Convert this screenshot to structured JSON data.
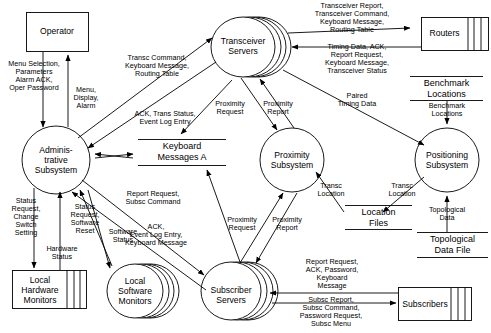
{
  "diagram": {
    "nodes": {
      "operator": {
        "label": "Operator",
        "type": "external-entity"
      },
      "transceiver_servers": {
        "label": "Transceiver\nServers",
        "type": "process-multi"
      },
      "routers": {
        "label": "Routers",
        "type": "external-entity-multi"
      },
      "benchmark_locations_store": {
        "label": "Benchmark\nLocations",
        "type": "data-store"
      },
      "administrative_subsystem": {
        "label": "Adminis-\ntrative\nSubsystem",
        "type": "process"
      },
      "keyboard_messages_a": {
        "label": "Keyboard\nMessages A",
        "type": "data-store"
      },
      "proximity_subsystem": {
        "label": "Proximity\nSubsystem",
        "type": "process"
      },
      "positioning_subsystem": {
        "label": "Positioning\nSubsystem",
        "type": "process"
      },
      "location_files": {
        "label": "Location\nFiles",
        "type": "data-store"
      },
      "topological_data_file": {
        "label": "Topological\nData File",
        "type": "data-store"
      },
      "local_hardware_monitors": {
        "label": "Local\nHardware\nMonitors",
        "type": "external-entity-multi"
      },
      "local_software_monitors": {
        "label": "Local\nSoftware\nMonitors",
        "type": "process-multi"
      },
      "subscriber_servers": {
        "label": "Subscriber\nServers",
        "type": "process-multi"
      },
      "subscribers": {
        "label": "Subscribers",
        "type": "external-entity-multi"
      }
    },
    "flows": [
      {
        "id": "f1",
        "label": "Menu Selection,\nParameters\nAlarm ACK,\nOper Password",
        "from": "operator",
        "to": "administrative_subsystem"
      },
      {
        "id": "f2",
        "label": "Menu,\nDisplay,\nAlarm",
        "from": "administrative_subsystem",
        "to": "operator"
      },
      {
        "id": "f3",
        "label": "Transc Command,\nKeyboard Message,\nRouting Table",
        "from": "administrative_subsystem",
        "to": "transceiver_servers"
      },
      {
        "id": "f4",
        "label": "ACK, Trans Status,\nEvent Log Entry",
        "from": "transceiver_servers",
        "to": "administrative_subsystem"
      },
      {
        "id": "f5",
        "label": "Transceiver Report,\nTransceiver Command,\nKeyboard Message,\nRouting Table",
        "from": "transceiver_servers",
        "to": "routers"
      },
      {
        "id": "f6",
        "label": "Timing Data, ACK,\nReport Request,\nKeyboard Message,\nTransceiver Status",
        "from": "routers",
        "to": "transceiver_servers"
      },
      {
        "id": "f7",
        "label": "Paired\nTiming Data",
        "from": "transceiver_servers",
        "to": "positioning_subsystem"
      },
      {
        "id": "f8",
        "label": "Benchmark\nLocations",
        "from": "benchmark_locations_store",
        "to": "positioning_subsystem"
      },
      {
        "id": "f9",
        "label": "Topological\nData",
        "from": "topological_data_file",
        "to": "positioning_subsystem"
      },
      {
        "id": "f10",
        "label": "Transc\nLocation",
        "from": "positioning_subsystem",
        "to": "location_files"
      },
      {
        "id": "f11",
        "label": "Transc\nLocation",
        "from": "location_files",
        "to": "proximity_subsystem"
      },
      {
        "id": "f12",
        "label": "Proximity\nRequest",
        "from": "transceiver_servers",
        "to": "proximity_subsystem"
      },
      {
        "id": "f13",
        "label": "Proximity\nReport",
        "from": "proximity_subsystem",
        "to": "transceiver_servers"
      },
      {
        "id": "f14",
        "label": "Proximity\nRequest",
        "from": "subscriber_servers",
        "to": "proximity_subsystem"
      },
      {
        "id": "f15",
        "label": "Proximity\nReport",
        "from": "proximity_subsystem",
        "to": "subscriber_servers"
      },
      {
        "id": "f16",
        "label": "Report Request,\nSubsc Command",
        "from": "administrative_subsystem",
        "to": "subscriber_servers"
      },
      {
        "id": "f17",
        "label": "ACK,\nEvent Log Entry,\nKeyboard Message",
        "from": "subscriber_servers",
        "to": "administrative_subsystem"
      },
      {
        "id": "f18",
        "label": "Status\nRequest,\nChange\nSwitch\nSetting",
        "from": "administrative_subsystem",
        "to": "local_hardware_monitors"
      },
      {
        "id": "f19",
        "label": "Hardware\nStatus",
        "from": "local_hardware_monitors",
        "to": "administrative_subsystem"
      },
      {
        "id": "f20",
        "label": "Status\nRequest,\nSoftware\nReset",
        "from": "administrative_subsystem",
        "to": "local_software_monitors"
      },
      {
        "id": "f21",
        "label": "Software\nStatus",
        "from": "local_software_monitors",
        "to": "administrative_subsystem"
      },
      {
        "id": "f22",
        "label": "Report Request,\nACK, Password,\nKeyboard\nMessage",
        "from": "subscribers",
        "to": "subscriber_servers"
      },
      {
        "id": "f23",
        "label": "Subsc Report,\nSubsc Command,\nPassword Request,\nSubsc Menu",
        "from": "subscriber_servers",
        "to": "subscribers"
      },
      {
        "id": "f24",
        "label": "Keyboard Messages A",
        "from": "administrative_subsystem",
        "to": "keyboard_messages_a"
      }
    ]
  }
}
